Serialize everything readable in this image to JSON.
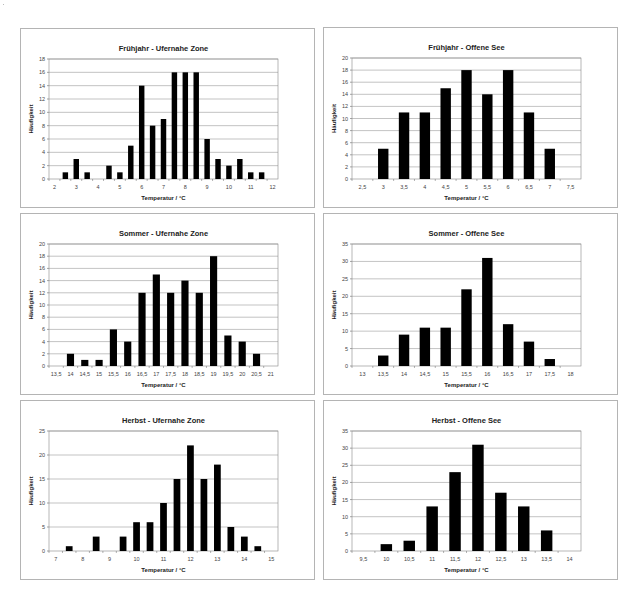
{
  "page": {
    "ylabel": "Häufigkeit",
    "xlabel": "Temperatur / °C",
    "bar_color": "#000000",
    "grid_color": "#9a9a9a",
    "border_color": "#b4b4b4"
  },
  "chart_data": [
    {
      "type": "bar",
      "title": "Frühjahr - Ufernahe Zone",
      "xlabel": "Temperatur / °C",
      "ylabel": "Häufigkeit",
      "categories": [
        "2",
        "2,5",
        "3",
        "3,5",
        "4",
        "4,5",
        "5",
        "5,5",
        "6",
        "6,5",
        "7",
        "7,5",
        "8",
        "8,5",
        "9",
        "9,5",
        "10",
        "10,5",
        "11",
        "11,5",
        "12"
      ],
      "tick_labels": [
        "2",
        "",
        "3",
        "",
        "4",
        "",
        "5",
        "",
        "6",
        "",
        "7",
        "",
        "8",
        "",
        "9",
        "",
        "10",
        "",
        "11",
        "",
        "12"
      ],
      "values": [
        0,
        1,
        3,
        1,
        0,
        2,
        1,
        5,
        14,
        8,
        9,
        16,
        16,
        16,
        6,
        3,
        2,
        3,
        1,
        1,
        0
      ],
      "ylim": [
        0,
        18
      ],
      "ystep": 2,
      "grid": true,
      "legend": "none"
    },
    {
      "type": "bar",
      "title": "Frühjahr - Offene See",
      "xlabel": "Temperatur / °C",
      "ylabel": "Häufigkeit",
      "categories": [
        "2,5",
        "3",
        "3,5",
        "4",
        "4,5",
        "5",
        "5,5",
        "6",
        "6,5",
        "7",
        "7,5"
      ],
      "tick_labels": [
        "2,5",
        "3",
        "3,5",
        "4",
        "4,5",
        "5",
        "5,5",
        "6",
        "6,5",
        "7",
        "7,5"
      ],
      "values": [
        0,
        5,
        11,
        11,
        15,
        18,
        14,
        18,
        11,
        5,
        0
      ],
      "ylim": [
        0,
        20
      ],
      "ystep": 2,
      "grid": true,
      "legend": "none"
    },
    {
      "type": "bar",
      "title": "Sommer - Ufernahe Zone",
      "xlabel": "Temperatur / °C",
      "ylabel": "Häufigkeit",
      "categories": [
        "13,5",
        "14",
        "14,5",
        "15",
        "15,5",
        "16",
        "16,5",
        "17",
        "17,5",
        "18",
        "18,5",
        "19",
        "19,5",
        "20",
        "20,5",
        "21"
      ],
      "tick_labels": [
        "13,5",
        "14",
        "14,5",
        "15",
        "15,5",
        "16",
        "16,5",
        "17",
        "17,5",
        "18",
        "18,5",
        "19",
        "19,5",
        "20",
        "20,5",
        "21"
      ],
      "values": [
        0,
        2,
        1,
        1,
        6,
        4,
        12,
        15,
        12,
        14,
        12,
        18,
        5,
        4,
        2,
        0
      ],
      "ylim": [
        0,
        20
      ],
      "ystep": 2,
      "grid": true,
      "legend": "none"
    },
    {
      "type": "bar",
      "title": "Sommer - Offene See",
      "xlabel": "Temperatur / °C",
      "ylabel": "Häufigkeit",
      "categories": [
        "13",
        "13,5",
        "14",
        "14,5",
        "15",
        "15,5",
        "16",
        "16,5",
        "17",
        "17,5",
        "18"
      ],
      "tick_labels": [
        "13",
        "13,5",
        "14",
        "14,5",
        "15",
        "15,5",
        "16",
        "16,5",
        "17",
        "17,5",
        "18"
      ],
      "values": [
        0,
        3,
        9,
        11,
        11,
        22,
        31,
        12,
        7,
        2,
        0
      ],
      "ylim": [
        0,
        35
      ],
      "ystep": 5,
      "grid": true,
      "legend": "none"
    },
    {
      "type": "bar",
      "title": "Herbst - Ufernahe Zone",
      "xlabel": "Temperatur / °C",
      "ylabel": "Häufigkeit",
      "categories": [
        "7",
        "7,5",
        "8",
        "8,5",
        "9",
        "9,5",
        "10",
        "10,5",
        "11",
        "11,5",
        "12",
        "12,5",
        "13",
        "13,5",
        "14",
        "14,5",
        "15"
      ],
      "tick_labels": [
        "7",
        "",
        "8",
        "",
        "9",
        "",
        "10",
        "",
        "11",
        "",
        "12",
        "",
        "13",
        "",
        "14",
        "",
        "15"
      ],
      "values": [
        0,
        1,
        0,
        3,
        0,
        3,
        6,
        6,
        10,
        15,
        22,
        15,
        18,
        5,
        3,
        1,
        0
      ],
      "ylim": [
        0,
        25
      ],
      "ystep": 5,
      "grid": true,
      "legend": "none"
    },
    {
      "type": "bar",
      "title": "Herbst - Offene See",
      "xlabel": "Temperatur / °C",
      "ylabel": "Häufigkeit",
      "categories": [
        "9,5",
        "10",
        "10,5",
        "11",
        "11,5",
        "12",
        "12,5",
        "13",
        "13,5",
        "14"
      ],
      "tick_labels": [
        "9,5",
        "10",
        "10,5",
        "11",
        "11,5",
        "12",
        "12,5",
        "13",
        "13,5",
        "14"
      ],
      "values": [
        0,
        2,
        3,
        13,
        23,
        31,
        17,
        13,
        6,
        0
      ],
      "ylim": [
        0,
        35
      ],
      "ystep": 5,
      "grid": true,
      "legend": "none"
    }
  ]
}
